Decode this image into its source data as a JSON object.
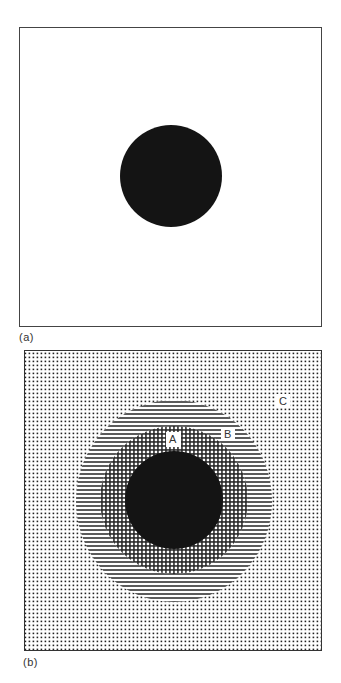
{
  "figure": {
    "panels": [
      {
        "id": "a",
        "label": "(a)",
        "description": "Solid black disc centered on a plain white field",
        "regions": [
          {
            "name": "disc",
            "fill": "solid-black"
          }
        ]
      },
      {
        "id": "b",
        "label": "(b)",
        "description": "Black disc surrounded by concentric zones with different hatching",
        "regions": [
          {
            "name": "disc",
            "fill": "solid-black"
          },
          {
            "name": "A",
            "label": "A",
            "fill": "crosshatch"
          },
          {
            "name": "B",
            "label": "B",
            "fill": "horizontal-lines"
          },
          {
            "name": "C",
            "label": "C",
            "fill": "dots"
          }
        ]
      }
    ],
    "colors": {
      "ink": "#141414",
      "paper": "#ffffff",
      "border": "#444444"
    }
  }
}
